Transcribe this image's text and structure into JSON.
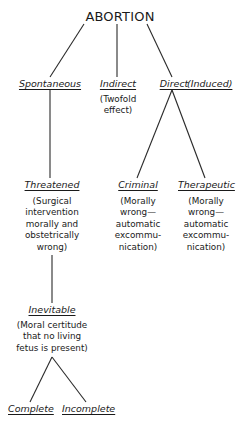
{
  "diagram": {
    "root": "ABORTION",
    "nodes": {
      "spontaneous": {
        "label": "Spontaneous"
      },
      "indirect": {
        "label": "Indirect",
        "note": "(Twofold\neffect)"
      },
      "direct": {
        "label": "Direct",
        "label_secondary": "(Induced)"
      },
      "threatened": {
        "label": "Threatened",
        "note": "(Surgical\nintervention\nmorally and\nobstetrically\nwrong)"
      },
      "criminal": {
        "label": "Criminal",
        "note": "(Morally\nwrong—\nautomatic\nexcommu-\nnication)"
      },
      "therapeutic": {
        "label": "Therapeutic",
        "note": "(Morally\nwrong—\nautomatic\nexcommu-\nnication)"
      },
      "inevitable": {
        "label": "Inevitable",
        "note": "(Moral certitude\nthat no living\nfetus is present)"
      },
      "complete": {
        "label": "Complete"
      },
      "incomplete": {
        "label": "Incomplete"
      }
    },
    "edges": [
      [
        "ABORTION",
        "Spontaneous"
      ],
      [
        "ABORTION",
        "Indirect"
      ],
      [
        "ABORTION",
        "Direct"
      ],
      [
        "Spontaneous",
        "Threatened"
      ],
      [
        "Direct",
        "Criminal"
      ],
      [
        "Direct",
        "Therapeutic"
      ],
      [
        "Threatened",
        "Inevitable"
      ],
      [
        "Inevitable",
        "Complete"
      ],
      [
        "Inevitable",
        "Incomplete"
      ]
    ],
    "line_color": "#2a2a2a"
  }
}
